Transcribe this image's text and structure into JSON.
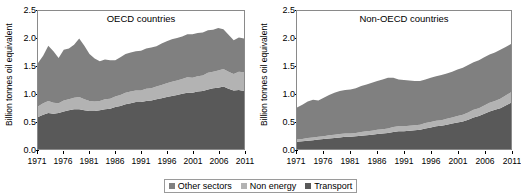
{
  "chart_data": [
    {
      "type": "area",
      "title": "OECD countries",
      "xlabel": "",
      "ylabel": "Billion tonnes oil equivalent",
      "ylim": [
        0,
        2.5
      ],
      "yticks": [
        0.0,
        0.5,
        1.0,
        1.5,
        2.0,
        2.5
      ],
      "ytick_labels": [
        "0.0",
        "0.5",
        "1.0",
        "1.5",
        "2.0",
        "2.5"
      ],
      "xlim": [
        1971,
        2011
      ],
      "xticks": [
        1971,
        1976,
        1981,
        1986,
        1991,
        1996,
        2001,
        2006,
        2011
      ],
      "xtick_labels": [
        "1971",
        "1976",
        "1981",
        "1986",
        "1991",
        "1996",
        "2001",
        "2006",
        "2011"
      ],
      "grid": false,
      "stacked": true,
      "x": [
        1971,
        1972,
        1973,
        1974,
        1975,
        1976,
        1977,
        1978,
        1979,
        1980,
        1981,
        1982,
        1983,
        1984,
        1985,
        1986,
        1987,
        1988,
        1989,
        1990,
        1991,
        1992,
        1993,
        1994,
        1995,
        1996,
        1997,
        1998,
        1999,
        2000,
        2001,
        2002,
        2003,
        2004,
        2005,
        2006,
        2007,
        2008,
        2009,
        2010,
        2011
      ],
      "series": [
        {
          "name": "Transport",
          "values": [
            0.58,
            0.62,
            0.65,
            0.64,
            0.65,
            0.68,
            0.7,
            0.72,
            0.72,
            0.7,
            0.69,
            0.69,
            0.7,
            0.72,
            0.73,
            0.76,
            0.78,
            0.81,
            0.83,
            0.85,
            0.85,
            0.87,
            0.88,
            0.9,
            0.92,
            0.94,
            0.96,
            0.98,
            1.0,
            1.02,
            1.02,
            1.04,
            1.05,
            1.08,
            1.1,
            1.11,
            1.13,
            1.09,
            1.06,
            1.07,
            1.05
          ]
        },
        {
          "name": "Non energy",
          "values": [
            0.19,
            0.21,
            0.22,
            0.2,
            0.18,
            0.2,
            0.2,
            0.21,
            0.22,
            0.2,
            0.18,
            0.17,
            0.17,
            0.18,
            0.18,
            0.19,
            0.2,
            0.21,
            0.21,
            0.21,
            0.21,
            0.22,
            0.22,
            0.23,
            0.24,
            0.25,
            0.26,
            0.26,
            0.27,
            0.28,
            0.27,
            0.28,
            0.28,
            0.3,
            0.3,
            0.31,
            0.32,
            0.31,
            0.3,
            0.33,
            0.34
          ]
        },
        {
          "name": "Other sectors",
          "values": [
            0.79,
            0.86,
            1.0,
            0.93,
            0.82,
            0.92,
            0.92,
            0.96,
            1.06,
            0.97,
            0.85,
            0.78,
            0.72,
            0.72,
            0.7,
            0.66,
            0.68,
            0.7,
            0.71,
            0.71,
            0.72,
            0.73,
            0.74,
            0.73,
            0.75,
            0.76,
            0.77,
            0.77,
            0.77,
            0.78,
            0.79,
            0.78,
            0.78,
            0.77,
            0.76,
            0.77,
            0.72,
            0.67,
            0.61,
            0.62,
            0.61
          ]
        }
      ]
    },
    {
      "type": "area",
      "title": "Non-OECD countries",
      "xlabel": "",
      "ylabel": "Billion tonnes oil equivalent",
      "ylim": [
        0,
        2.5
      ],
      "yticks": [
        0.0,
        0.5,
        1.0,
        1.5,
        2.0,
        2.5
      ],
      "ytick_labels": [
        "0.0",
        "0.5",
        "1.0",
        "1.5",
        "2.0",
        "2.5"
      ],
      "xlim": [
        1971,
        2011
      ],
      "xticks": [
        1971,
        1976,
        1981,
        1986,
        1991,
        1996,
        2001,
        2006,
        2011
      ],
      "xtick_labels": [
        "1971",
        "1976",
        "1981",
        "1986",
        "1991",
        "1996",
        "2001",
        "2006",
        "2011"
      ],
      "grid": false,
      "stacked": true,
      "x": [
        1971,
        1972,
        1973,
        1974,
        1975,
        1976,
        1977,
        1978,
        1979,
        1980,
        1981,
        1982,
        1983,
        1984,
        1985,
        1986,
        1987,
        1988,
        1989,
        1990,
        1991,
        1992,
        1993,
        1994,
        1995,
        1996,
        1997,
        1998,
        1999,
        2000,
        2001,
        2002,
        2003,
        2004,
        2005,
        2006,
        2007,
        2008,
        2009,
        2010,
        2011
      ],
      "series": [
        {
          "name": "Transport",
          "values": [
            0.13,
            0.14,
            0.15,
            0.16,
            0.17,
            0.18,
            0.19,
            0.2,
            0.21,
            0.22,
            0.22,
            0.23,
            0.24,
            0.25,
            0.26,
            0.27,
            0.28,
            0.29,
            0.31,
            0.32,
            0.32,
            0.33,
            0.34,
            0.35,
            0.37,
            0.39,
            0.41,
            0.42,
            0.44,
            0.46,
            0.48,
            0.5,
            0.53,
            0.57,
            0.6,
            0.64,
            0.68,
            0.71,
            0.74,
            0.79,
            0.84
          ]
        },
        {
          "name": "Non energy",
          "values": [
            0.04,
            0.04,
            0.05,
            0.05,
            0.05,
            0.05,
            0.06,
            0.06,
            0.06,
            0.06,
            0.06,
            0.06,
            0.07,
            0.07,
            0.07,
            0.08,
            0.08,
            0.08,
            0.09,
            0.09,
            0.09,
            0.09,
            0.09,
            0.09,
            0.1,
            0.1,
            0.1,
            0.1,
            0.11,
            0.11,
            0.12,
            0.12,
            0.13,
            0.14,
            0.14,
            0.15,
            0.16,
            0.16,
            0.17,
            0.18,
            0.19
          ]
        },
        {
          "name": "Other sectors",
          "values": [
            0.58,
            0.62,
            0.66,
            0.68,
            0.66,
            0.7,
            0.73,
            0.76,
            0.78,
            0.79,
            0.8,
            0.81,
            0.83,
            0.85,
            0.87,
            0.88,
            0.9,
            0.92,
            0.89,
            0.85,
            0.84,
            0.82,
            0.8,
            0.79,
            0.79,
            0.8,
            0.81,
            0.82,
            0.82,
            0.83,
            0.84,
            0.85,
            0.86,
            0.86,
            0.87,
            0.87,
            0.87,
            0.88,
            0.89,
            0.88,
            0.87
          ]
        }
      ]
    }
  ],
  "legend": {
    "position": "bottom-center",
    "items": [
      {
        "label": "Other sectors",
        "color": "#808080"
      },
      {
        "label": "Non energy",
        "color": "#b3b3b3"
      },
      {
        "label": "Transport",
        "color": "#595959"
      }
    ]
  },
  "colors": {
    "other_sectors": "#808080",
    "non_energy": "#b3b3b3",
    "transport": "#595959",
    "axis": "#000000",
    "frame": "#8a8a8a",
    "background": "#ffffff"
  }
}
